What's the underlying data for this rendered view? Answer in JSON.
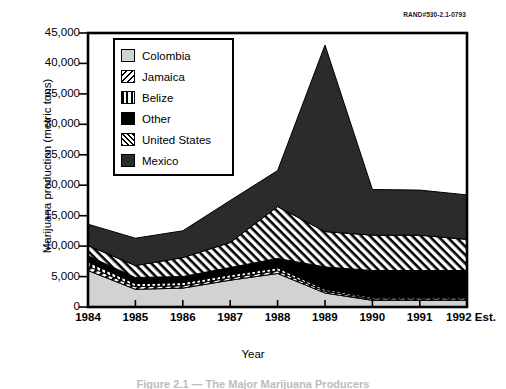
{
  "rand_code": "RAND#530-2.1-0793",
  "axes": {
    "y_title": "Marijuana production (metric tons)",
    "x_title": "Year",
    "y_ticks": [
      "0",
      "5,000",
      "10,000",
      "15,000",
      "20,000",
      "25,000",
      "30,000",
      "35,000",
      "40,000",
      "45,000"
    ],
    "x_ticks": [
      "1984",
      "1985",
      "1986",
      "1987",
      "1988",
      "1989",
      "1990",
      "1991",
      "1992 Est."
    ]
  },
  "caption": "Figure 2.1 — The Major Marijuana Producers",
  "legend": {
    "items": [
      {
        "label": "Colombia",
        "swatch": "colombia-swatch-icon",
        "color": "#d2d2d2"
      },
      {
        "label": "Jamaica",
        "swatch": "jamaica-swatch-icon",
        "color": "#000000"
      },
      {
        "label": "Belize",
        "swatch": "belize-swatch-icon",
        "color": "#000000"
      },
      {
        "label": "Other",
        "swatch": "other-swatch-icon",
        "color": "#000000"
      },
      {
        "label": "United States",
        "swatch": "united-states-swatch-icon",
        "color": "#000000"
      },
      {
        "label": "Mexico",
        "swatch": "mexico-swatch-icon",
        "color": "#2b2b2b"
      }
    ]
  },
  "chart_data": {
    "type": "area",
    "stacked": true,
    "title": "",
    "xlabel": "Year",
    "ylabel": "Marijuana production (metric tons)",
    "categories": [
      "1984",
      "1985",
      "1986",
      "1987",
      "1988",
      "1989",
      "1990",
      "1991",
      "1992 Est."
    ],
    "ylim": [
      0,
      45000
    ],
    "ytick_step": 5000,
    "grid": false,
    "legend_position": "inside-top-left",
    "series": [
      {
        "name": "Colombia",
        "values": [
          6000,
          2900,
          3100,
          4400,
          5500,
          2300,
          1100,
          1100,
          1100
        ]
      },
      {
        "name": "Jamaica",
        "values": [
          700,
          450,
          400,
          400,
          450,
          300,
          250,
          250,
          250
        ]
      },
      {
        "name": "Belize",
        "values": [
          700,
          500,
          500,
          500,
          500,
          300,
          250,
          250,
          250
        ]
      },
      {
        "name": "Other",
        "values": [
          1000,
          1000,
          1000,
          1200,
          1550,
          3700,
          4400,
          4400,
          4400
        ]
      },
      {
        "name": "United States",
        "values": [
          1700,
          1950,
          3100,
          4100,
          8500,
          5800,
          5800,
          5800,
          5100
        ]
      },
      {
        "name": "Mexico",
        "values": [
          3500,
          4500,
          4400,
          6900,
          5900,
          30600,
          7500,
          7400,
          7300
        ]
      }
    ],
    "totals": [
      13600,
      11300,
      12500,
      17500,
      22400,
      43000,
      19300,
      19200,
      18400
    ]
  }
}
